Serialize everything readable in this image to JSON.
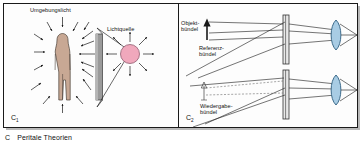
{
  "figure": {
    "caption_letter": "C",
    "caption_text": "Peritale Theorien"
  },
  "panel_left": {
    "id": "C",
    "id_sub": "1",
    "labels": {
      "ambient_light": "Umgebungslicht",
      "light_source": "Lichtquelle"
    },
    "elements": {
      "person": "human-figure",
      "plate": "holographic-plate",
      "lamp": "point-light-source"
    },
    "colors": {
      "person_fill": "#c8a894",
      "person_stroke": "#4a4038",
      "plate_fill": "#9a9a9a",
      "plate_stroke": "#3a3a3a",
      "lamp_fill": "#f0a8bc",
      "lamp_stroke": "#8f5d70",
      "ray_stroke": "#1a1a1a"
    }
  },
  "panel_right": {
    "id": "C",
    "id_sub": "2",
    "sub_top": {
      "labels": {
        "object_beam_line1": "Objekt-",
        "object_beam_line2": "bündel",
        "reference_beam_line1": "Referenz-",
        "reference_beam_line2": "bündel"
      }
    },
    "sub_bottom": {
      "labels": {
        "reconstruction_beam_line1": "Wiedergabe-",
        "reconstruction_beam_line2": "bündel"
      }
    },
    "colors": {
      "lens_fill": "#a8cce4",
      "lens_stroke": "#2f5f80",
      "plate_fill": "#e8e8e8",
      "plate_stroke": "#333333",
      "beam_stroke": "#2a2a2a",
      "arrow_fill": "#1a1a1a"
    }
  },
  "frame": {
    "border_color": "#1a1a1a",
    "background": "#fdfdfd",
    "shadow_color": "#b9b9b9"
  }
}
